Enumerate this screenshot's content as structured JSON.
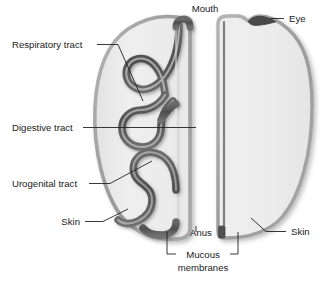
{
  "figure": {
    "background_color": "#ffffff",
    "body_fill_color": "#ececec",
    "body_outline_color": "#9a9a9a",
    "tract_color": "#5c5c5c",
    "tract_inner_color": "#f2f2f2",
    "label_color": "#1b1b1b",
    "leader_color": "#222222"
  },
  "labels": {
    "mouth": "Mouth",
    "eye": "Eye",
    "respiratory_tract": "Respiratory tract",
    "digestive_tract": "Digestive tract",
    "urogenital_tract": "Urogenital tract",
    "skin_left": "Skin",
    "skin_right": "Skin",
    "anus": "Anus",
    "mucous_membranes_line1": "Mucous",
    "mucous_membranes_line2": "membranes"
  },
  "label_list": [
    {
      "id": "mouth",
      "text": "Mouth",
      "x": 205,
      "y": 11,
      "align": "middle",
      "side": "top"
    },
    {
      "id": "eye",
      "text": "Eye",
      "x": 299,
      "y": 21,
      "align": "middle",
      "side": "top-right"
    },
    {
      "id": "respiratory-tract",
      "text": "Respiratory tract",
      "x": 11,
      "y": 48,
      "align": "start",
      "side": "left"
    },
    {
      "id": "digestive-tract",
      "text": "Digestive tract",
      "x": 11,
      "y": 131,
      "align": "start",
      "side": "left"
    },
    {
      "id": "urogenital-tract",
      "text": "Urogenital tract",
      "x": 11,
      "y": 187,
      "align": "start",
      "side": "left"
    },
    {
      "id": "skin-left",
      "text": "Skin",
      "x": 81,
      "y": 225,
      "align": "end",
      "side": "left"
    },
    {
      "id": "anus",
      "text": "Anus",
      "x": 191,
      "y": 239,
      "align": "start",
      "side": "bottom"
    },
    {
      "id": "mucous-membranes",
      "text": "Mucous membranes",
      "x": 207,
      "y": 262,
      "align": "middle",
      "side": "bottom"
    },
    {
      "id": "skin-right",
      "text": "Skin",
      "x": 290,
      "y": 235,
      "align": "start",
      "side": "right"
    }
  ],
  "parts": [
    {
      "id": "left-body-half",
      "name": "Left body half (sagittal, internal tracts shown)"
    },
    {
      "id": "right-body-half",
      "name": "Right body half (external surface)"
    },
    {
      "id": "respiratory-tube",
      "name": "Respiratory tract tube"
    },
    {
      "id": "digestive-tube",
      "name": "Digestive tract tube"
    },
    {
      "id": "urogenital-tube",
      "name": "Urogenital tract tube"
    },
    {
      "id": "eye-marker",
      "name": "Eye opening"
    },
    {
      "id": "mouth-opening",
      "name": "Mouth opening"
    },
    {
      "id": "anus-opening",
      "name": "Anus opening"
    }
  ]
}
